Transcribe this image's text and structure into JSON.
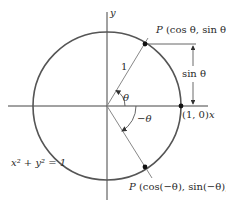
{
  "diagram": {
    "type": "unit-circle",
    "axes": {
      "x_label": "x",
      "y_label": "y"
    },
    "equation_label": "x² + y² = 1",
    "points": {
      "p_upper": {
        "label_prefix": "P",
        "label_coords": "(cos θ, sin θ)"
      },
      "p_lower": {
        "label_prefix": "P",
        "label_coords": "(cos(−θ), sin(−θ))"
      },
      "unit_point": {
        "label": "(1, 0)"
      }
    },
    "radius_label": "1",
    "angle_labels": {
      "theta": "θ",
      "neg_theta": "−θ"
    },
    "dimension_label": "sin θ",
    "colors": {
      "circle": "#555555",
      "axes": "#444444",
      "radius_lines": "#888888",
      "points": "#111111",
      "text": "#2a2a2a"
    }
  }
}
